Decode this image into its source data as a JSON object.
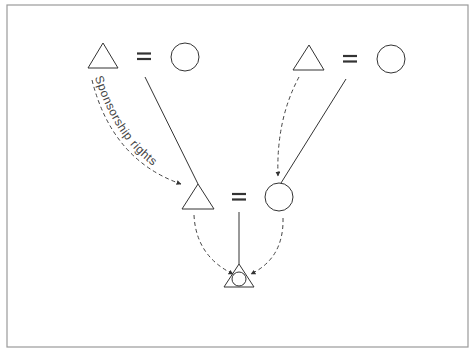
{
  "diagram": {
    "type": "kinship-diagram",
    "frame_color": "#9a9a9a",
    "line_color": "#333333",
    "label": "Sponsorship rights",
    "nodes": [
      {
        "id": "grandfather-left",
        "shape": "triangle"
      },
      {
        "id": "grandmother-left",
        "shape": "circle"
      },
      {
        "id": "grandfather-right",
        "shape": "triangle"
      },
      {
        "id": "grandmother-right",
        "shape": "circle"
      },
      {
        "id": "father",
        "shape": "triangle"
      },
      {
        "id": "mother",
        "shape": "circle"
      },
      {
        "id": "child",
        "shape": "triangle-with-circle"
      }
    ],
    "relations": [
      {
        "type": "marriage",
        "symbol": "="
      },
      {
        "type": "descent",
        "style": "solid"
      },
      {
        "type": "sponsorship",
        "style": "dashed-arrow"
      }
    ]
  }
}
